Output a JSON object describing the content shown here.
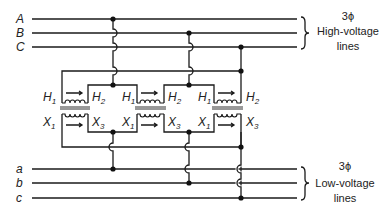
{
  "diagram": {
    "type": "three-phase transformer bank wiring diagram",
    "high_voltage": {
      "phase_labels": [
        "A",
        "B",
        "C"
      ],
      "caption_symbol": "3ϕ",
      "caption_line1": "High-voltage",
      "caption_line2": "lines"
    },
    "low_voltage": {
      "phase_labels": [
        "a",
        "b",
        "c"
      ],
      "caption_symbol": "3ϕ",
      "caption_line1": "Low-voltage",
      "caption_line2": "lines"
    },
    "transformers": [
      {
        "h_left": "H",
        "h_left_sub": "1",
        "h_right": "H",
        "h_right_sub": "2",
        "x_left": "X",
        "x_left_sub": "1",
        "x_right": "X",
        "x_right_sub": "3"
      },
      {
        "h_left": "H",
        "h_left_sub": "1",
        "h_right": "H",
        "h_right_sub": "2",
        "x_left": "X",
        "x_left_sub": "1",
        "x_right": "X",
        "x_right_sub": "3"
      },
      {
        "h_left": "H",
        "h_left_sub": "1",
        "h_right": "H",
        "h_right_sub": "2",
        "x_left": "X",
        "x_left_sub": "1",
        "x_right": "X",
        "x_right_sub": "3"
      }
    ],
    "colors": {
      "ink": "#1a1a1a",
      "background": "#ffffff"
    }
  }
}
